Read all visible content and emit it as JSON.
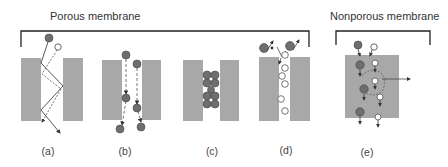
{
  "figure": {
    "groups": [
      {
        "id": "porous",
        "title": "Porous membrane"
      },
      {
        "id": "nonporous",
        "title": "Nonporous membrane"
      }
    ],
    "panels": [
      {
        "id": "a",
        "label": "(a)"
      },
      {
        "id": "b",
        "label": "(b)"
      },
      {
        "id": "c",
        "label": "(c)"
      },
      {
        "id": "d",
        "label": "(d)"
      },
      {
        "id": "e",
        "label": "(e)"
      }
    ],
    "colors": {
      "membrane": "#a8a8a8",
      "large_molecule": "#6e6e6e",
      "small_molecule": "#ffffff",
      "stroke": "#333333",
      "bracket": "#222222"
    }
  }
}
